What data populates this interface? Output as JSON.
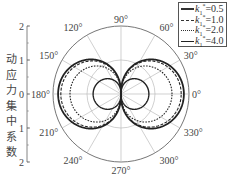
{
  "chart_data": {
    "type": "polar-line",
    "title": "",
    "ylabel": "动应力集中系数",
    "ylabel_chars": [
      "动",
      "应",
      "力",
      "集",
      "中",
      "系",
      "数"
    ],
    "radial_axis": {
      "range": [
        0,
        2
      ],
      "ticks": [
        "2",
        "1",
        "0",
        "1",
        "2"
      ],
      "gridlines": [
        1,
        2
      ]
    },
    "angular_axis": {
      "unit": "degree",
      "ticks": [
        0,
        30,
        60,
        90,
        120,
        150,
        180,
        210,
        240,
        270,
        300,
        330
      ],
      "tick_labels": [
        "0°",
        "30°",
        "60°",
        "90°",
        "120°",
        "150°",
        "180°",
        "210°",
        "240°",
        "270°",
        "300°",
        "330°"
      ]
    },
    "legend_position": "upper-right",
    "series": [
      {
        "name": "k1*=0.5",
        "label_k": "k",
        "label_sub": "1",
        "label_sup": "*",
        "label_val": "=0.5",
        "style": "solid-thick",
        "peak_at_0_180": 1.85
      },
      {
        "name": "k1*=1.0",
        "label_k": "k",
        "label_sub": "1",
        "label_sup": "*",
        "label_val": "=1.0",
        "style": "dashed",
        "peak_at_0_180": 1.77
      },
      {
        "name": "k1*=2.0",
        "label_k": "k",
        "label_sub": "1",
        "label_sup": "*",
        "label_val": "=2.0",
        "style": "dotted",
        "peak_at_0_180": 1.5
      },
      {
        "name": "k1*=4.0",
        "label_k": "k",
        "label_sub": "1",
        "label_sup": "*",
        "label_val": "=4.0",
        "style": "solid",
        "peak_at_0_180": 0.82
      }
    ],
    "note": "Each curve is a two-lobed figure-eight: maximum at 0° and 180°, zero at 90° and 270°."
  },
  "colors": {
    "axis": "#555555",
    "grid": "#bbbbbb",
    "curve": "#222222"
  }
}
